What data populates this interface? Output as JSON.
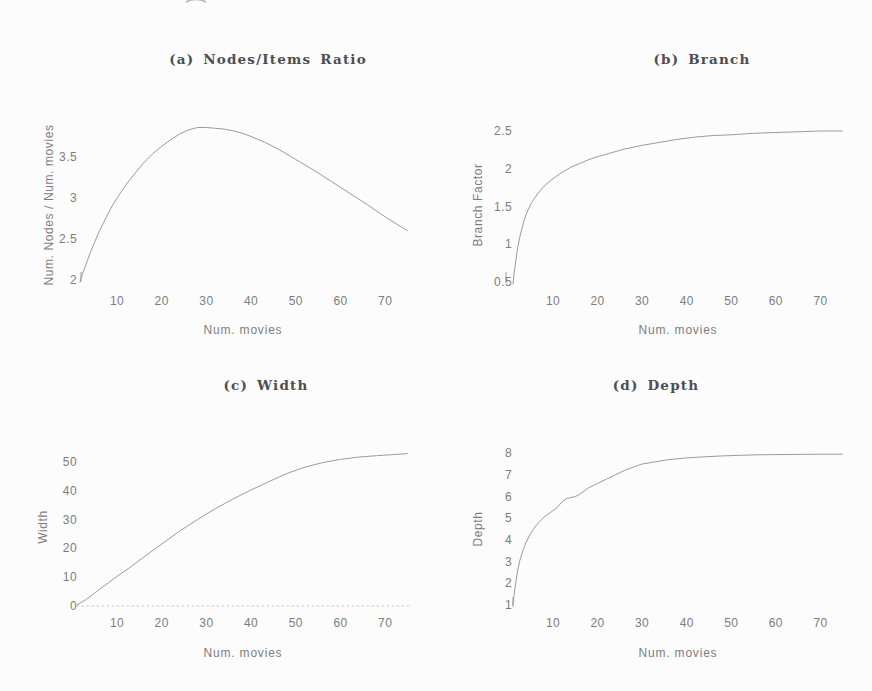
{
  "colors": {
    "background": "#fcfcfc",
    "curve": "#9b9b9b",
    "dashed_baseline": "#bdbdbd",
    "tick_text": "#7c7c7c",
    "title_text": "#4e4e4e"
  },
  "chart_data": [
    {
      "type": "line",
      "panel": "a",
      "title": "(a) Nodes/Items Ratio",
      "xlabel": "Num. movies",
      "ylabel": "Num. Nodes / Num. movies",
      "xticks": [
        10,
        20,
        30,
        40,
        50,
        60,
        70
      ],
      "yticks": [
        2,
        2.5,
        3,
        3.5
      ],
      "xlim": [
        1,
        76
      ],
      "ylim": [
        1.95,
        3.95
      ],
      "grid": false,
      "legend": null,
      "series": [
        {
          "name": "nodes-items-ratio",
          "style": "solid",
          "x": [
            1.7,
            2,
            3,
            4,
            5,
            6,
            7,
            8,
            9,
            10,
            12,
            14,
            16,
            18,
            20,
            22,
            24,
            26,
            28,
            30,
            32,
            34,
            36,
            38,
            40,
            43,
            46,
            50,
            54,
            58,
            62,
            66,
            70,
            75
          ],
          "y": [
            1.97,
            2.03,
            2.18,
            2.33,
            2.46,
            2.59,
            2.7,
            2.81,
            2.91,
            3.0,
            3.16,
            3.3,
            3.43,
            3.54,
            3.63,
            3.71,
            3.78,
            3.83,
            3.86,
            3.86,
            3.85,
            3.84,
            3.82,
            3.79,
            3.75,
            3.68,
            3.6,
            3.47,
            3.34,
            3.2,
            3.06,
            2.92,
            2.77,
            2.6
          ]
        }
      ]
    },
    {
      "type": "line",
      "panel": "b",
      "title": "(b) Branch",
      "xlabel": "Num. movies",
      "ylabel": "Branch Factor",
      "xticks": [
        10,
        20,
        30,
        40,
        50,
        60,
        70
      ],
      "yticks": [
        0.5,
        1,
        1.5,
        2,
        2.5
      ],
      "xlim": [
        1,
        76
      ],
      "ylim": [
        0.4,
        2.6
      ],
      "grid": false,
      "legend": null,
      "series": [
        {
          "name": "branch-factor",
          "style": "solid",
          "x": [
            1,
            1.3,
            1.7,
            2,
            2.5,
            3,
            3.5,
            4,
            5,
            6,
            7,
            8,
            9,
            10,
            12,
            14,
            16,
            18,
            20,
            23,
            26,
            30,
            34,
            38,
            42,
            46,
            50,
            55,
            60,
            65,
            70,
            75
          ],
          "y": [
            0.47,
            0.63,
            0.8,
            0.93,
            1.08,
            1.2,
            1.31,
            1.4,
            1.53,
            1.62,
            1.7,
            1.77,
            1.82,
            1.87,
            1.95,
            2.02,
            2.07,
            2.12,
            2.16,
            2.21,
            2.26,
            2.31,
            2.35,
            2.39,
            2.42,
            2.44,
            2.45,
            2.47,
            2.48,
            2.49,
            2.5,
            2.5
          ]
        }
      ]
    },
    {
      "type": "line",
      "panel": "c",
      "title": "(c) Width",
      "xlabel": "Num. movies",
      "ylabel": "Width",
      "xticks": [
        10,
        20,
        30,
        40,
        50,
        60,
        70
      ],
      "yticks": [
        0,
        10,
        20,
        30,
        40,
        50
      ],
      "xlim": [
        1,
        76
      ],
      "ylim": [
        0,
        55
      ],
      "grid": false,
      "legend": null,
      "series": [
        {
          "name": "width",
          "style": "solid",
          "x": [
            1,
            3,
            5,
            8,
            10,
            13,
            16,
            20,
            24,
            28,
            32,
            36,
            40,
            44,
            48,
            52,
            56,
            60,
            64,
            68,
            72,
            75
          ],
          "y": [
            0.3,
            2.2,
            4.5,
            8.0,
            10.3,
            13.5,
            17.0,
            21.5,
            26.0,
            30.0,
            33.8,
            37.2,
            40.3,
            43.2,
            46.0,
            48.2,
            49.8,
            50.9,
            51.7,
            52.2,
            52.6,
            52.9
          ]
        },
        {
          "name": "zero-baseline",
          "style": "dashed",
          "x": [
            1,
            76
          ],
          "y": [
            0,
            0
          ]
        }
      ]
    },
    {
      "type": "line",
      "panel": "d",
      "title": "(d) Depth",
      "xlabel": "Num. movies",
      "ylabel": "Depth",
      "xticks": [
        10,
        20,
        30,
        40,
        50,
        60,
        70
      ],
      "yticks": [
        1,
        2,
        3,
        4,
        5,
        6,
        7,
        8
      ],
      "xlim": [
        1,
        76
      ],
      "ylim": [
        0.8,
        8.3
      ],
      "grid": false,
      "legend": null,
      "series": [
        {
          "name": "depth",
          "style": "solid",
          "x": [
            1,
            1.3,
            1.7,
            2,
            2.5,
            3,
            3.5,
            4,
            5,
            6,
            7,
            8,
            9,
            10,
            11,
            12,
            13,
            14,
            15,
            16,
            17,
            18,
            19,
            20,
            22,
            24,
            26,
            28,
            30,
            33,
            36,
            40,
            44,
            48,
            52,
            56,
            60,
            65,
            70,
            75
          ],
          "y": [
            1.0,
            1.5,
            2.1,
            2.5,
            3.0,
            3.35,
            3.65,
            3.9,
            4.3,
            4.6,
            4.85,
            5.05,
            5.2,
            5.35,
            5.5,
            5.75,
            5.9,
            5.95,
            6.0,
            6.1,
            6.25,
            6.4,
            6.5,
            6.6,
            6.8,
            7.0,
            7.2,
            7.35,
            7.5,
            7.6,
            7.7,
            7.78,
            7.83,
            7.87,
            7.9,
            7.92,
            7.93,
            7.94,
            7.95,
            7.95
          ]
        }
      ]
    }
  ]
}
